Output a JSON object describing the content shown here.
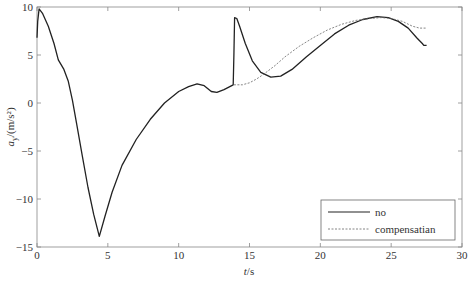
{
  "chart_data": {
    "type": "line",
    "title": "",
    "xlabel": "t/s",
    "ylabel": "a_y/(m/s²)",
    "xlim": [
      0,
      30
    ],
    "ylim": [
      -15,
      10
    ],
    "xticks": [
      0,
      5,
      10,
      15,
      20,
      25,
      30
    ],
    "yticks": [
      -15,
      -10,
      -5,
      0,
      5,
      10
    ],
    "xtick_labels": [
      "0",
      "5",
      "10",
      "15",
      "20",
      "25",
      "30"
    ],
    "ytick_labels": [
      "−15",
      "−10",
      "−5",
      "0",
      "5",
      "10"
    ],
    "grid": false,
    "legend_position": "lower right",
    "series": [
      {
        "name": "no",
        "style": "solid",
        "color": "#222222",
        "x": [
          0,
          0.05,
          0.15,
          0.4,
          0.8,
          1.2,
          1.5,
          1.9,
          2.2,
          2.5,
          2.8,
          3.2,
          3.6,
          4.0,
          4.4,
          4.8,
          5.3,
          6.0,
          7.0,
          8.0,
          9.0,
          10.0,
          10.7,
          11.3,
          11.8,
          12.3,
          12.7,
          13.2,
          13.85,
          13.9,
          13.95,
          14.1,
          14.3,
          14.7,
          15.2,
          15.8,
          16.5,
          17.2,
          18.0,
          19.0,
          20.0,
          21.0,
          22.0,
          23.0,
          24.0,
          24.8,
          25.5,
          26.2,
          26.8,
          27.2,
          27.3,
          27.5
        ],
        "y": [
          6.8,
          8.5,
          9.8,
          9.3,
          8.0,
          6.2,
          4.5,
          3.5,
          2.3,
          0.3,
          -2.2,
          -5.5,
          -8.8,
          -11.6,
          -13.9,
          -11.8,
          -9.3,
          -6.5,
          -3.8,
          -1.7,
          0.0,
          1.2,
          1.7,
          2.0,
          1.8,
          1.2,
          1.1,
          1.4,
          1.9,
          5.0,
          8.9,
          8.8,
          8.0,
          6.2,
          4.4,
          3.2,
          2.7,
          2.8,
          3.5,
          4.8,
          6.0,
          7.2,
          8.1,
          8.7,
          9.0,
          8.9,
          8.5,
          7.8,
          6.8,
          6.2,
          6.0,
          6.0
        ]
      },
      {
        "name": "compensatian",
        "style": "dashed",
        "color": "#666666",
        "x": [
          13.9,
          14.5,
          15.0,
          15.5,
          16.0,
          16.8,
          17.5,
          18.5,
          19.5,
          20.5,
          21.5,
          22.5,
          23.5,
          24.3,
          25.0,
          25.8,
          26.5,
          27.0,
          27.5
        ],
        "y": [
          1.9,
          1.9,
          2.1,
          2.5,
          3.0,
          3.9,
          4.8,
          5.9,
          6.8,
          7.6,
          8.2,
          8.6,
          8.8,
          8.9,
          8.8,
          8.5,
          8.0,
          7.8,
          7.8
        ]
      }
    ]
  },
  "legend": {
    "items": [
      {
        "label": "no"
      },
      {
        "label": "compensatian"
      }
    ]
  },
  "axes": {
    "xlabel_italic": "t",
    "xlabel_rest": "/s",
    "ylabel_italic": "a",
    "ylabel_sub": "y",
    "ylabel_rest": "/(m/s²)"
  }
}
